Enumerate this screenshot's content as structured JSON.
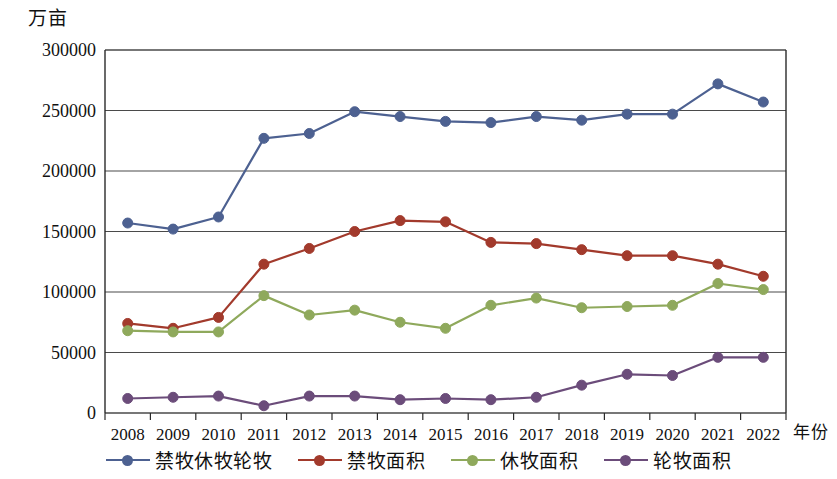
{
  "axes": {
    "y_unit_label": "万亩",
    "x_unit_label": "年份"
  },
  "legend": {
    "items": [
      {
        "label": "禁牧休牧轮牧",
        "color": "#4d6191"
      },
      {
        "label": "禁牧面积",
        "color": "#a23a2c"
      },
      {
        "label": "休牧面积",
        "color": "#8fa95c"
      },
      {
        "label": "轮牧面积",
        "color": "#6b4c7a"
      }
    ]
  },
  "chart_data": {
    "type": "line",
    "title": "",
    "xlabel": "年份",
    "ylabel": "万亩",
    "categories": [
      "2008",
      "2009",
      "2010",
      "2011",
      "2012",
      "2013",
      "2014",
      "2015",
      "2016",
      "2017",
      "2018",
      "2019",
      "2020",
      "2021",
      "2022"
    ],
    "ylim": [
      0,
      300000
    ],
    "ytick_values": [
      0,
      50000,
      100000,
      150000,
      200000,
      250000,
      300000
    ],
    "ytick_labels": [
      "0",
      "50000",
      "100000",
      "150000",
      "200000",
      "250000",
      "300000"
    ],
    "grid": true,
    "legend_position": "bottom",
    "series": [
      {
        "name": "禁牧休牧轮牧",
        "color": "#4d6191",
        "values": [
          157000,
          152000,
          162000,
          227000,
          231000,
          249000,
          245000,
          241000,
          240000,
          245000,
          242000,
          247000,
          247000,
          272000,
          257000
        ]
      },
      {
        "name": "禁牧面积",
        "color": "#a23a2c",
        "values": [
          74000,
          70000,
          79000,
          123000,
          136000,
          150000,
          159000,
          158000,
          141000,
          140000,
          135000,
          130000,
          130000,
          123000,
          113000
        ]
      },
      {
        "name": "休牧面积",
        "color": "#8fa95c",
        "values": [
          68000,
          67000,
          67000,
          97000,
          81000,
          85000,
          75000,
          70000,
          89000,
          95000,
          87000,
          88000,
          89000,
          107000,
          102000
        ]
      },
      {
        "name": "轮牧面积",
        "color": "#6b4c7a",
        "values": [
          12000,
          13000,
          14000,
          6000,
          14000,
          14000,
          11000,
          12000,
          11000,
          13000,
          23000,
          32000,
          31000,
          46000,
          46000
        ]
      }
    ]
  }
}
